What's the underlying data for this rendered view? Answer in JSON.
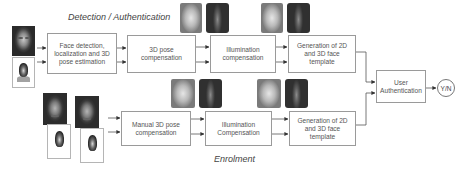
{
  "diagram": {
    "sections": {
      "detection": "Detection / Authentication",
      "enrolment": "Enrolment"
    },
    "top_row": [
      {
        "id": "face-detection",
        "label": "Face detection,\nlocalization and 3D\npose estimation"
      },
      {
        "id": "pose-compensation",
        "label": "3D pose\ncompensation"
      },
      {
        "id": "illumination-compensation",
        "label": "Illumination\ncompensation"
      },
      {
        "id": "template-generation",
        "label": "Generation of 2D\nand 3D face\ntemplate"
      }
    ],
    "bottom_row": [
      {
        "id": "manual-pose-compensation",
        "label": "Manual 3D pose\ncompensation"
      },
      {
        "id": "illumination-compensation",
        "label": "Illumination\nCompensation"
      },
      {
        "id": "template-generation",
        "label": "Generation of 2D\nand 3D face\ntemplate"
      }
    ],
    "auth": {
      "label": "User\nAuthentication"
    },
    "output": {
      "label": "Y/N"
    },
    "images": {
      "input_top": [
        "color photo (portrait)",
        "depth/3D scan (portrait)"
      ],
      "input_bottom": [
        "color photo 1",
        "depth scan 1",
        "color photo 2",
        "depth scan 2"
      ],
      "top_thumbnails": [
        "pose-compensated texture",
        "pose-compensated depth",
        "illumination-compensated texture",
        "illumination-compensated depth"
      ],
      "bottom_thumbnails": [
        "pose-compensated texture",
        "pose-compensated depth",
        "illumination-compensated texture",
        "illumination-compensated depth"
      ]
    },
    "colors": {
      "line": "#6a6a6a",
      "box_border": "#9a9a9a",
      "text": "#555555"
    }
  }
}
